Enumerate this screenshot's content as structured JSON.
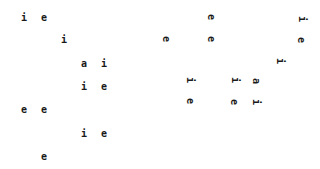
{
  "canvas": {
    "background": "#ffffff",
    "glyph_color": "#1a1a1a"
  },
  "upright_glyphs": [
    {
      "char": "i",
      "x": 24,
      "y": 18
    },
    {
      "char": "e",
      "x": 44,
      "y": 18
    },
    {
      "char": "i",
      "x": 64,
      "y": 40
    },
    {
      "char": "a",
      "x": 84,
      "y": 64
    },
    {
      "char": "i",
      "x": 104,
      "y": 64
    },
    {
      "char": "i",
      "x": 84,
      "y": 87
    },
    {
      "char": "e",
      "x": 104,
      "y": 87
    },
    {
      "char": "e",
      "x": 24,
      "y": 110
    },
    {
      "char": "e",
      "x": 44,
      "y": 110
    },
    {
      "char": "i",
      "x": 84,
      "y": 134
    },
    {
      "char": "e",
      "x": 104,
      "y": 134
    },
    {
      "char": "e",
      "x": 44,
      "y": 157
    }
  ],
  "rotated_glyphs": [
    {
      "char": "e",
      "x": 211,
      "y": 17
    },
    {
      "char": "i",
      "x": 302,
      "y": 19
    },
    {
      "char": "e",
      "x": 166,
      "y": 39
    },
    {
      "char": "e",
      "x": 211,
      "y": 39
    },
    {
      "char": "e",
      "x": 301,
      "y": 40
    },
    {
      "char": "i",
      "x": 280,
      "y": 61
    },
    {
      "char": "i",
      "x": 190,
      "y": 80
    },
    {
      "char": "i",
      "x": 235,
      "y": 80
    },
    {
      "char": "a",
      "x": 256,
      "y": 81
    },
    {
      "char": "e",
      "x": 190,
      "y": 101
    },
    {
      "char": "e",
      "x": 234,
      "y": 102
    },
    {
      "char": "i",
      "x": 256,
      "y": 102
    }
  ]
}
